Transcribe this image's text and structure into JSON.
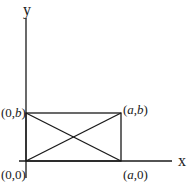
{
  "diagram": {
    "axes": {
      "x_label": "x",
      "y_label": "y"
    },
    "rectangle": {
      "vertices": [
        {
          "id": "origin",
          "label_pre": "(0,0)",
          "label": "(0,0)"
        },
        {
          "id": "a0",
          "label_pre": "(",
          "italic": "a",
          "label_post": ",0)"
        },
        {
          "id": "ab",
          "label_pre": "(",
          "italic": "a",
          "mid": ",",
          "italic2": "b",
          "label_post": ")"
        },
        {
          "id": "0b",
          "label_pre": "(0,",
          "italic": "b",
          "label_post": ")"
        }
      ],
      "diagonals": 2
    },
    "colors": {
      "line": "#1a1a1a",
      "background": "#ffffff"
    }
  }
}
